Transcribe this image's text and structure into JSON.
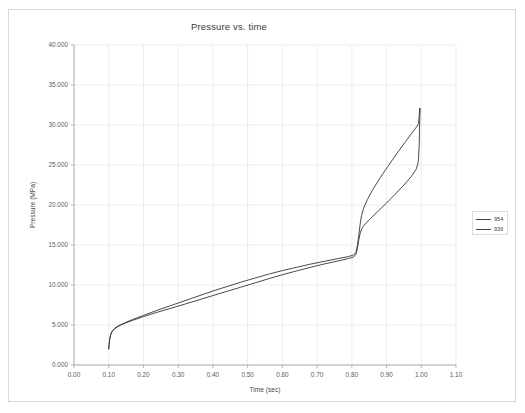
{
  "chart_data": {
    "type": "line",
    "title": "Pressure vs. time",
    "xlabel": "Time (sec)",
    "ylabel": "Pressure (MPa)",
    "xlim": [
      0.0,
      1.1
    ],
    "ylim": [
      0.0,
      40.0
    ],
    "grid": true,
    "legend_position": "right",
    "x_tick_labels": [
      "0.00",
      "0.10",
      "0.20",
      "0.30",
      "0.40",
      "0.50",
      "0.60",
      "0.70",
      "0.80",
      "0.90",
      "1.00",
      "1.10"
    ],
    "x_tick_values": [
      0.0,
      0.1,
      0.2,
      0.3,
      0.4,
      0.5,
      0.6,
      0.7,
      0.8,
      0.9,
      1.0,
      1.1
    ],
    "y_tick_labels": [
      "0.000",
      "5.000",
      "10.000",
      "15.000",
      "20.000",
      "25.000",
      "30.000",
      "35.000",
      "40.000"
    ],
    "y_tick_values": [
      0,
      5,
      10,
      15,
      20,
      25,
      30,
      35,
      40
    ],
    "series": [
      {
        "name": "954",
        "color": "#404040",
        "points": [
          [
            0.1,
            2.0
          ],
          [
            0.101,
            2.6
          ],
          [
            0.103,
            3.3
          ],
          [
            0.106,
            3.85
          ],
          [
            0.11,
            4.25
          ],
          [
            0.116,
            4.55
          ],
          [
            0.124,
            4.8
          ],
          [
            0.135,
            5.05
          ],
          [
            0.15,
            5.35
          ],
          [
            0.17,
            5.7
          ],
          [
            0.2,
            6.2
          ],
          [
            0.24,
            6.85
          ],
          [
            0.28,
            7.45
          ],
          [
            0.32,
            8.05
          ],
          [
            0.36,
            8.65
          ],
          [
            0.4,
            9.25
          ],
          [
            0.44,
            9.8
          ],
          [
            0.48,
            10.35
          ],
          [
            0.52,
            10.85
          ],
          [
            0.56,
            11.35
          ],
          [
            0.6,
            11.8
          ],
          [
            0.64,
            12.2
          ],
          [
            0.68,
            12.6
          ],
          [
            0.72,
            12.95
          ],
          [
            0.76,
            13.3
          ],
          [
            0.79,
            13.55
          ],
          [
            0.805,
            13.75
          ],
          [
            0.812,
            14.1
          ],
          [
            0.816,
            14.9
          ],
          [
            0.82,
            16.2
          ],
          [
            0.824,
            17.6
          ],
          [
            0.828,
            18.7
          ],
          [
            0.834,
            19.6
          ],
          [
            0.845,
            20.7
          ],
          [
            0.86,
            21.9
          ],
          [
            0.88,
            23.3
          ],
          [
            0.905,
            24.9
          ],
          [
            0.93,
            26.45
          ],
          [
            0.955,
            27.95
          ],
          [
            0.975,
            29.1
          ],
          [
            0.988,
            29.85
          ],
          [
            0.992,
            30.2
          ],
          [
            0.994,
            31.1
          ],
          [
            0.995,
            32.05
          ]
        ]
      },
      {
        "name": "936",
        "color": "#404040",
        "points": [
          [
            0.1,
            2.0
          ],
          [
            0.101,
            2.55
          ],
          [
            0.103,
            3.25
          ],
          [
            0.106,
            3.8
          ],
          [
            0.11,
            4.2
          ],
          [
            0.116,
            4.5
          ],
          [
            0.124,
            4.75
          ],
          [
            0.135,
            5.0
          ],
          [
            0.15,
            5.28
          ],
          [
            0.17,
            5.6
          ],
          [
            0.2,
            6.05
          ],
          [
            0.24,
            6.6
          ],
          [
            0.28,
            7.1
          ],
          [
            0.32,
            7.62
          ],
          [
            0.36,
            8.15
          ],
          [
            0.4,
            8.68
          ],
          [
            0.44,
            9.2
          ],
          [
            0.48,
            9.72
          ],
          [
            0.52,
            10.25
          ],
          [
            0.56,
            10.78
          ],
          [
            0.6,
            11.28
          ],
          [
            0.64,
            11.75
          ],
          [
            0.68,
            12.2
          ],
          [
            0.72,
            12.62
          ],
          [
            0.76,
            13.0
          ],
          [
            0.79,
            13.3
          ],
          [
            0.805,
            13.5
          ],
          [
            0.812,
            13.85
          ],
          [
            0.816,
            14.55
          ],
          [
            0.82,
            15.6
          ],
          [
            0.824,
            16.5
          ],
          [
            0.83,
            17.15
          ],
          [
            0.84,
            17.7
          ],
          [
            0.855,
            18.35
          ],
          [
            0.875,
            19.2
          ],
          [
            0.9,
            20.25
          ],
          [
            0.925,
            21.35
          ],
          [
            0.95,
            22.5
          ],
          [
            0.972,
            23.6
          ],
          [
            0.985,
            24.45
          ],
          [
            0.99,
            25.1
          ],
          [
            0.992,
            25.7
          ],
          [
            0.994,
            27.4
          ],
          [
            0.995,
            29.6
          ],
          [
            0.996,
            31.2
          ],
          [
            0.997,
            32.05
          ]
        ]
      }
    ]
  }
}
